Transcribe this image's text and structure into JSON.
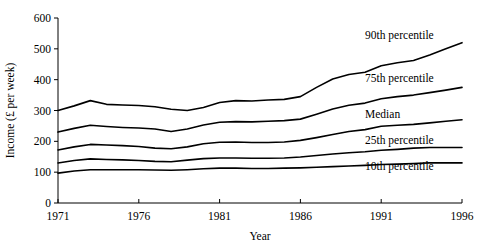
{
  "chart_data": {
    "type": "line",
    "title": "",
    "xlabel": "Year",
    "ylabel": "Income (£ per week)",
    "xlim": [
      1971,
      1996
    ],
    "ylim": [
      0,
      600
    ],
    "xticks": [
      1971,
      1976,
      1981,
      1986,
      1991,
      1996
    ],
    "xtick_labels": [
      "1971",
      "1976",
      "1981",
      "1986",
      "1991",
      "1996"
    ],
    "yticks": [
      0,
      100,
      200,
      300,
      400,
      500,
      600
    ],
    "ytick_labels": [
      "0",
      "100",
      "200",
      "300",
      "400",
      "500",
      "600"
    ],
    "grid": false,
    "legend_position": "inline-right-of-lines",
    "line_color": "#1a1a1a",
    "x": [
      1971,
      1972,
      1973,
      1974,
      1975,
      1976,
      1977,
      1978,
      1979,
      1980,
      1981,
      1982,
      1983,
      1984,
      1985,
      1986,
      1987,
      1988,
      1989,
      1990,
      1991,
      1992,
      1993,
      1994,
      1995,
      1996
    ],
    "series": [
      {
        "name": "90th percentile",
        "label": "90th percentile",
        "values": [
          300,
          315,
          332,
          320,
          318,
          316,
          312,
          304,
          300,
          310,
          326,
          332,
          331,
          334,
          336,
          345,
          375,
          402,
          417,
          424,
          445,
          455,
          462,
          480,
          500,
          520
        ]
      },
      {
        "name": "75th percentile",
        "label": "75th percentile",
        "values": [
          230,
          242,
          252,
          248,
          245,
          243,
          240,
          232,
          240,
          253,
          262,
          264,
          263,
          265,
          267,
          272,
          288,
          305,
          317,
          324,
          338,
          345,
          350,
          358,
          366,
          375
        ]
      },
      {
        "name": "Median",
        "label": "Median",
        "values": [
          172,
          182,
          190,
          188,
          186,
          183,
          178,
          176,
          182,
          192,
          197,
          198,
          196,
          196,
          198,
          203,
          212,
          222,
          232,
          238,
          249,
          252,
          255,
          260,
          265,
          270
        ]
      },
      {
        "name": "25th percentile",
        "label": "25th percentile",
        "values": [
          130,
          138,
          143,
          141,
          140,
          138,
          135,
          134,
          139,
          144,
          146,
          146,
          145,
          145,
          146,
          149,
          154,
          159,
          163,
          166,
          171,
          174,
          178,
          180,
          180,
          180
        ]
      },
      {
        "name": "10th percentile",
        "label": "10th percentile",
        "values": [
          97,
          104,
          108,
          108,
          108,
          108,
          107,
          106,
          108,
          111,
          113,
          113,
          112,
          112,
          113,
          114,
          116,
          118,
          120,
          122,
          125,
          126,
          128,
          130,
          130,
          130
        ]
      }
    ],
    "series_label_positions": [
      {
        "name": "90th percentile",
        "x": 1990.0,
        "y": 545
      },
      {
        "name": "75th percentile",
        "x": 1990.0,
        "y": 405
      },
      {
        "name": "Median",
        "x": 1990.0,
        "y": 290
      },
      {
        "name": "25th percentile",
        "x": 1990.0,
        "y": 205
      },
      {
        "name": "10th percentile",
        "x": 1990.0,
        "y": 120
      }
    ]
  }
}
